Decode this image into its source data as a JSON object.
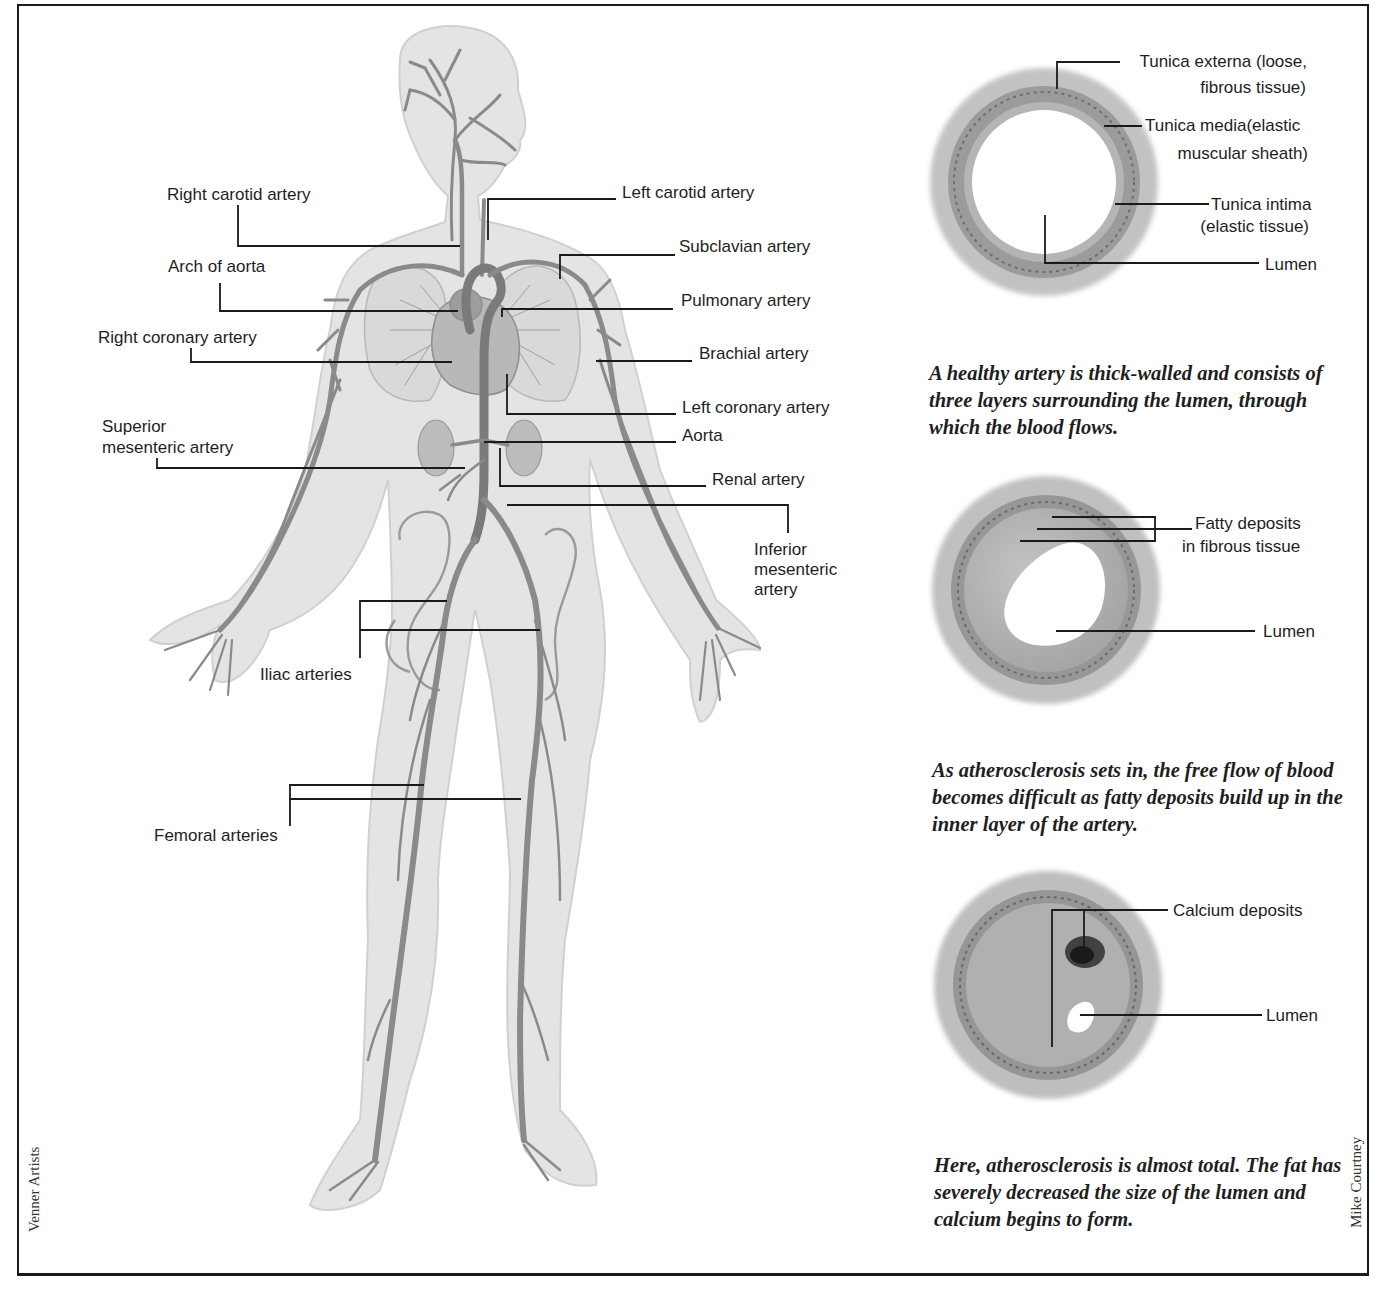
{
  "figure": {
    "body_labels": {
      "right_carotid": "Right carotid artery",
      "arch_of_aorta": "Arch of aorta",
      "right_coronary": "Right coronary artery",
      "superior_mesenteric_1": "Superior",
      "superior_mesenteric_2": "mesenteric artery",
      "iliac": "Iliac arteries",
      "femoral": "Femoral arteries",
      "left_carotid": "Left carotid artery",
      "subclavian": "Subclavian artery",
      "pulmonary": "Pulmonary artery",
      "brachial": "Brachial artery",
      "left_coronary": "Left coronary artery",
      "aorta": "Aorta",
      "renal": "Renal artery",
      "inferior_mesenteric_1": "Inferior",
      "inferior_mesenteric_2": "mesenteric",
      "inferior_mesenteric_3": "artery"
    },
    "healthy_artery": {
      "labels": {
        "externa_1": "Tunica externa (loose,",
        "externa_2": "fibrous tissue)",
        "media_1": "Tunica media(elastic",
        "media_2": "muscular sheath)",
        "intima_1": "Tunica intima",
        "intima_2": "(elastic tissue)",
        "lumen": "Lumen"
      },
      "caption": "A healthy artery is thick-walled and consists of three layers surrounding the lumen, through which the blood flows."
    },
    "early_atherosclerosis": {
      "labels": {
        "fatty_1": "Fatty deposits",
        "fatty_2": "in fibrous tissue",
        "lumen": "Lumen"
      },
      "caption": "As atherosclerosis sets in, the free flow of blood becomes difficult as fatty deposits build up in the inner layer of the artery."
    },
    "advanced_atherosclerosis": {
      "labels": {
        "calcium": "Calcium deposits",
        "lumen": "Lumen"
      },
      "caption": "Here, atherosclerosis is almost total. The fat has severely decreased the size of the lumen and calcium begins to form."
    },
    "credits": {
      "left": "Venner Artists",
      "right": "Mike Courtney"
    },
    "colors": {
      "line": "#1a1a1a",
      "skin": "#e6e6e6",
      "vessel": "#8a8a8a",
      "wall_outer": "#b4b4b4",
      "wall_media": "#8e8e8e"
    }
  }
}
